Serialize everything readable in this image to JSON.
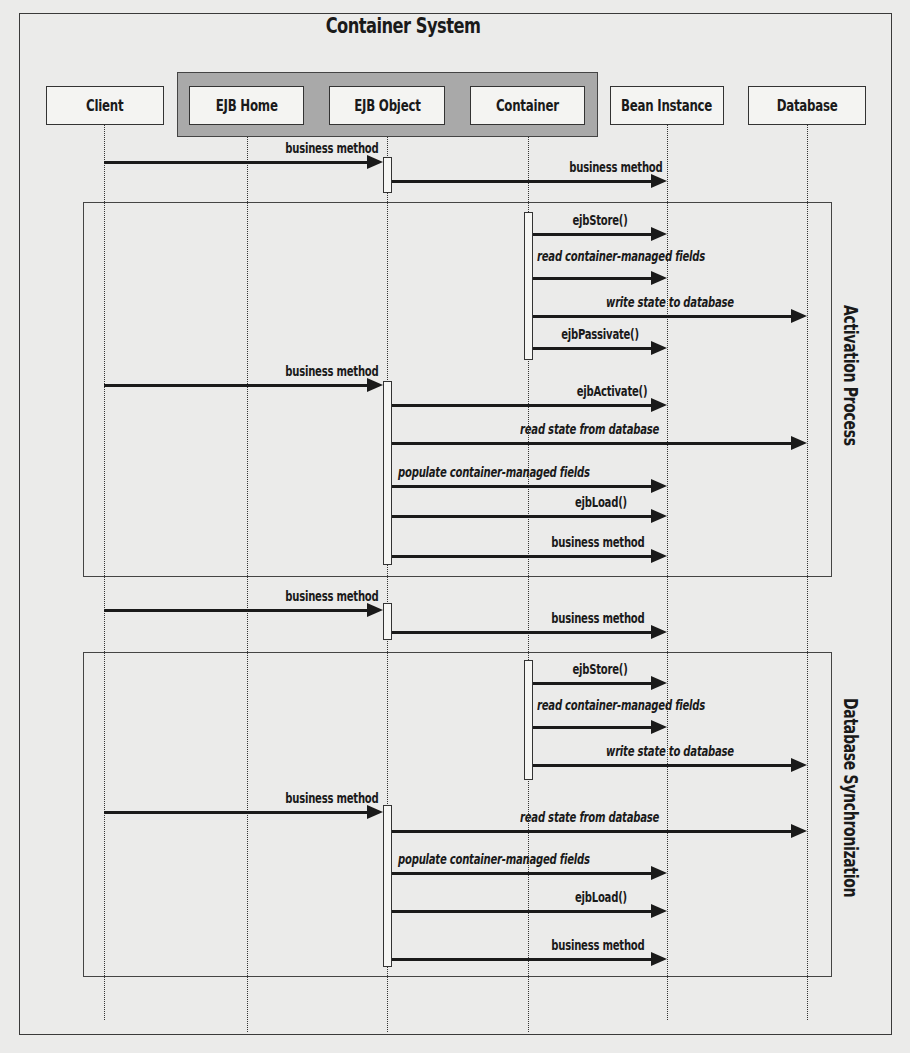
{
  "diagram": {
    "title": "Container System",
    "actors": [
      {
        "id": "client",
        "label": "Client",
        "x": 46,
        "w": 118,
        "lifeline": 104
      },
      {
        "id": "ejb_home",
        "label": "EJB Home",
        "x": 189,
        "w": 115,
        "lifeline": 247
      },
      {
        "id": "ejb_object",
        "label": "EJB Object",
        "x": 329,
        "w": 116,
        "lifeline": 387
      },
      {
        "id": "container",
        "label": "Container",
        "x": 470,
        "w": 115,
        "lifeline": 528
      },
      {
        "id": "bean_instance",
        "label": "Bean Instance",
        "x": 610,
        "w": 114,
        "lifeline": 667
      },
      {
        "id": "database",
        "label": "Database",
        "x": 748,
        "w": 118,
        "lifeline": 807
      }
    ],
    "container_group": [
      "EJB Home",
      "EJB Object",
      "Container"
    ],
    "sections": [
      {
        "label": "Activation Process",
        "top": 202,
        "height": 375
      },
      {
        "label": "Database Synchronization",
        "top": 652,
        "height": 325
      }
    ],
    "activation_bars": [
      {
        "on": "EJB Object",
        "top": 157,
        "height": 36
      },
      {
        "on": "Container",
        "top": 212,
        "height": 148
      },
      {
        "on": "EJB Object",
        "top": 381,
        "height": 184
      },
      {
        "on": "EJB Object",
        "top": 603,
        "height": 37
      },
      {
        "on": "Container",
        "top": 660,
        "height": 120
      },
      {
        "on": "EJB Object",
        "top": 805,
        "height": 162
      }
    ],
    "messages": [
      {
        "label": "business method",
        "from": "Client",
        "to": "EJB Object",
        "y": 162,
        "italic": false
      },
      {
        "label": "business method",
        "from": "EJB Object",
        "to": "Bean Instance",
        "y": 181,
        "italic": false
      },
      {
        "label": "ejbStore()",
        "from": "Container",
        "to": "Bean Instance",
        "y": 234,
        "italic": false
      },
      {
        "label": "read container-managed fields",
        "from": "Container",
        "to": "Bean Instance",
        "y": 278,
        "italic": true
      },
      {
        "label": "write state to database",
        "from": "Container",
        "to": "Database",
        "y": 316,
        "italic": true
      },
      {
        "label": "ejbPassivate()",
        "from": "Container",
        "to": "Bean Instance",
        "y": 348,
        "italic": false
      },
      {
        "label": "business method",
        "from": "Client",
        "to": "EJB Object",
        "y": 385,
        "italic": false
      },
      {
        "label": "ejbActivate()",
        "from": "EJB Object",
        "to": "Bean Instance",
        "y": 405,
        "italic": false
      },
      {
        "label": "read state from database",
        "from": "EJB Object",
        "to": "Database",
        "y": 443,
        "italic": true
      },
      {
        "label": "populate container-managed fields",
        "from": "EJB Object",
        "to": "Bean Instance",
        "y": 486,
        "italic": true
      },
      {
        "label": "ejbLoad()",
        "from": "EJB Object",
        "to": "Bean Instance",
        "y": 516,
        "italic": false
      },
      {
        "label": "business method",
        "from": "EJB Object",
        "to": "Bean Instance",
        "y": 556,
        "italic": false
      },
      {
        "label": "business method",
        "from": "Client",
        "to": "EJB Object",
        "y": 610,
        "italic": false
      },
      {
        "label": "business method",
        "from": "EJB Object",
        "to": "Bean Instance",
        "y": 632,
        "italic": false
      },
      {
        "label": "ejbStore()",
        "from": "Container",
        "to": "Bean Instance",
        "y": 683,
        "italic": false
      },
      {
        "label": "read container-managed fields",
        "from": "Container",
        "to": "Bean Instance",
        "y": 727,
        "italic": true
      },
      {
        "label": "write state to database",
        "from": "Container",
        "to": "Database",
        "y": 765,
        "italic": true
      },
      {
        "label": "business method",
        "from": "Client",
        "to": "EJB Object",
        "y": 812,
        "italic": false
      },
      {
        "label": "read state from database",
        "from": "EJB Object",
        "to": "Database",
        "y": 831,
        "italic": true
      },
      {
        "label": "populate container-managed fields",
        "from": "EJB Object",
        "to": "Bean Instance",
        "y": 873,
        "italic": true
      },
      {
        "label": "ejbLoad()",
        "from": "EJB Object",
        "to": "Bean Instance",
        "y": 911,
        "italic": false
      },
      {
        "label": "business method",
        "from": "EJB Object",
        "to": "Bean Instance",
        "y": 959,
        "italic": false
      }
    ]
  }
}
